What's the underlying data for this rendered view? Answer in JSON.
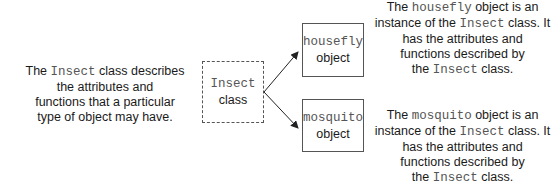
{
  "class_description": {
    "prefix": "The ",
    "class_name": "Insect",
    "line1_suffix": " class describes",
    "line2": "the attributes and",
    "line3": "functions that a particular",
    "line4": "type of object may have."
  },
  "class_box": {
    "name": "Insect",
    "label": "class",
    "style": "dashed"
  },
  "objects": [
    {
      "name": "housefly",
      "label": "object",
      "description": {
        "prefix": "The ",
        "name": "housefly",
        "line1_suffix": " object is an",
        "line2_prefix": "instance of the ",
        "class_name": "Insect",
        "line2_suffix": " class. It",
        "line3": "has the attributes and",
        "line4": "functions described by",
        "line5_prefix": "the ",
        "line5_suffix": " class."
      }
    },
    {
      "name": "mosquito",
      "label": "object",
      "description": {
        "prefix": "The ",
        "name": "mosquito",
        "line1_suffix": " object is an",
        "line2_prefix": "instance of the ",
        "class_name": "Insect",
        "line2_suffix": " class. It",
        "line3": "has the attributes and",
        "line4": "functions described by",
        "line5_prefix": "the ",
        "line5_suffix": " class."
      }
    }
  ],
  "colors": {
    "border": "#555555",
    "mono_text": "#555555",
    "text": "#1a1a1a"
  }
}
